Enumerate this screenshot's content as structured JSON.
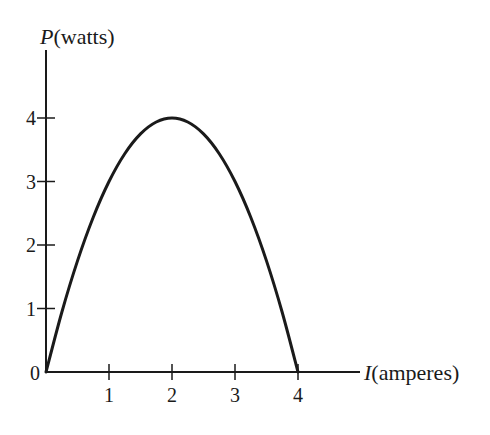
{
  "chart_data": {
    "type": "line",
    "title": "",
    "xlabel": "I(amperes)",
    "ylabel": "P(watts)",
    "xlabel_var": "I",
    "xlabel_unit": "(amperes)",
    "ylabel_var": "P",
    "ylabel_unit": "(watts)",
    "xlim": [
      0,
      4.9
    ],
    "ylim": [
      0,
      5.1
    ],
    "x_ticks": [
      1,
      2,
      3,
      4
    ],
    "y_ticks": [
      1,
      2,
      3,
      4
    ],
    "origin_label": "0",
    "grid": false,
    "legend": null,
    "series": [
      {
        "name": "P = 4I - I^2",
        "x": [
          0,
          0.25,
          0.5,
          0.75,
          1,
          1.25,
          1.5,
          1.75,
          2,
          2.25,
          2.5,
          2.75,
          3,
          3.25,
          3.5,
          3.75,
          4
        ],
        "y": [
          0,
          0.9375,
          1.75,
          2.4375,
          3,
          3.4375,
          3.75,
          3.9375,
          4,
          3.9375,
          3.75,
          3.4375,
          3,
          2.4375,
          1.75,
          0.9375,
          0
        ]
      }
    ],
    "colors": {
      "curve": "#1a1a1a",
      "axes": "#1a1a1a",
      "background": "#ffffff"
    }
  }
}
